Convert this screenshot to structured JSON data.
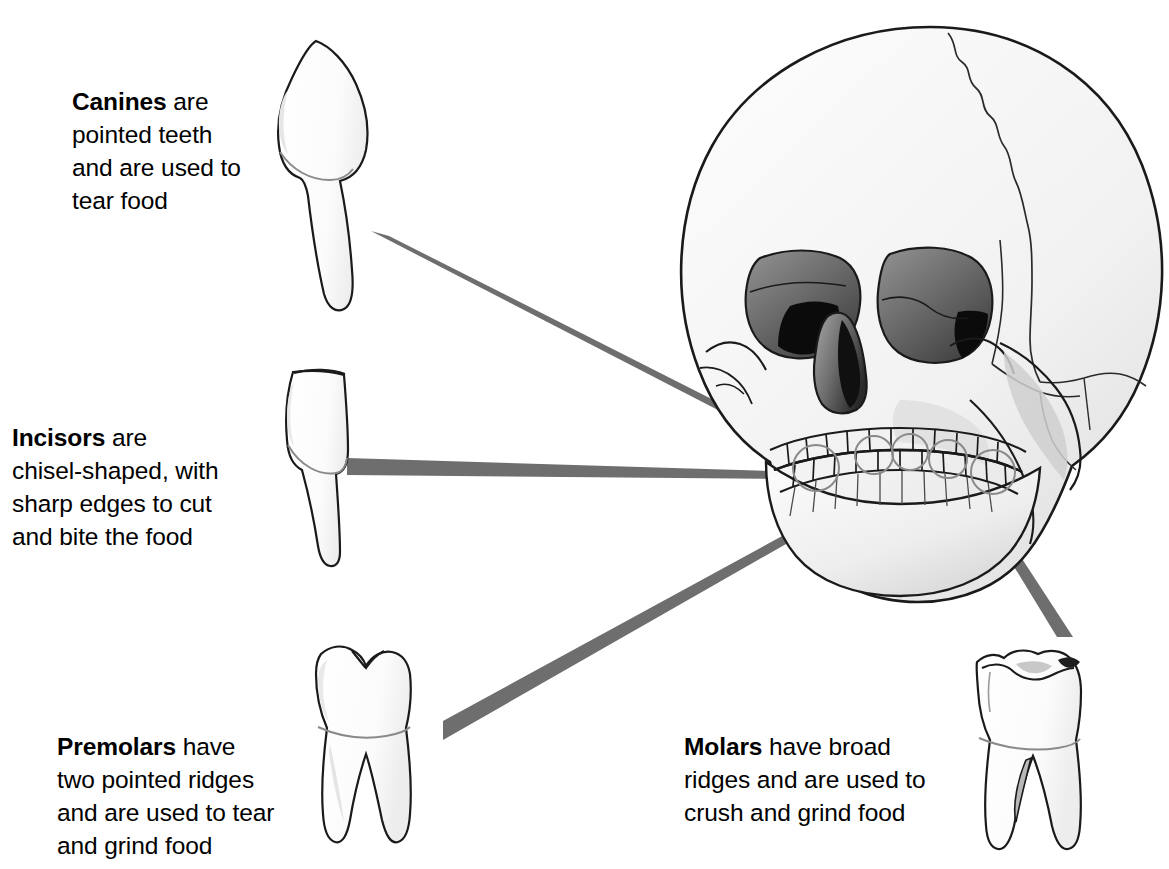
{
  "figure": {
    "background_color": "#ffffff",
    "leader_line_color": "#6e6e6e",
    "outline_color": "#1a1a1a",
    "bone_fill_color": "#f2f2f2"
  },
  "labels": {
    "canines": {
      "term": "Canines",
      "rest": " are\npointed teeth\nand are used to\ntear food",
      "full_text": "Canines are pointed teeth and are used to tear food"
    },
    "incisors": {
      "term": "Incisors",
      "rest": " are\nchisel-shaped, with\nsharp edges to cut\nand bite the food",
      "full_text": "Incisors are chisel-shaped, with sharp edges to cut and bite the food"
    },
    "premolars": {
      "term": "Premolars",
      "rest": " have\ntwo pointed ridges\nand are used to tear\nand grind food",
      "full_text": "Premolars have two pointed ridges and are used to tear and grind food"
    },
    "molars": {
      "term": "Molars",
      "rest": " have broad\nridges and are used to\ncrush and grind food",
      "full_text": "Molars have broad ridges and are used to crush and grind food"
    }
  },
  "illustrations": [
    {
      "name": "canine-tooth",
      "description": "Single pointed crown with one long tapered root",
      "roots": 1,
      "cusps": 1
    },
    {
      "name": "incisor-tooth",
      "description": "Chisel-shaped flat crown with one narrow root",
      "roots": 1,
      "cusps": 0
    },
    {
      "name": "premolar-tooth",
      "description": "Two pointed ridges (cusps) with two roots",
      "roots": 2,
      "cusps": 2
    },
    {
      "name": "molar-tooth",
      "description": "Broad ridged crown with two splayed roots",
      "roots": 2,
      "cusps": 3
    },
    {
      "name": "human-skull",
      "description": "Front three-quarter view of human skull showing upper and lower dental arches"
    }
  ],
  "leader_lines": [
    {
      "name": "leader-canines",
      "from": "canine-tooth",
      "to": "skull-canine-position"
    },
    {
      "name": "leader-incisors",
      "from": "incisor-tooth",
      "to": "skull-incisor-position"
    },
    {
      "name": "leader-premolars",
      "from": "premolar-tooth",
      "to": "skull-premolar-position"
    },
    {
      "name": "leader-molars",
      "from": "molar-tooth",
      "to": "skull-molar-position"
    }
  ]
}
